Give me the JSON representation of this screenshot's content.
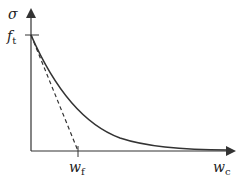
{
  "diagram": {
    "y_axis_label": "σ",
    "x_axis_label": "w",
    "x_axis_label_sub": "c",
    "y_tick_label": "f",
    "y_tick_label_sub": "t",
    "x_tick_label": "w",
    "x_tick_label_sub": "f",
    "curves": [
      {
        "name": "softening-curve",
        "style": "solid",
        "description": "nonlinear exponential-like decay from f_t to zero"
      },
      {
        "name": "linear-softening",
        "style": "dashed",
        "description": "linear decay from f_t to zero at w_f"
      }
    ],
    "colors": {
      "line": "#333333"
    }
  }
}
